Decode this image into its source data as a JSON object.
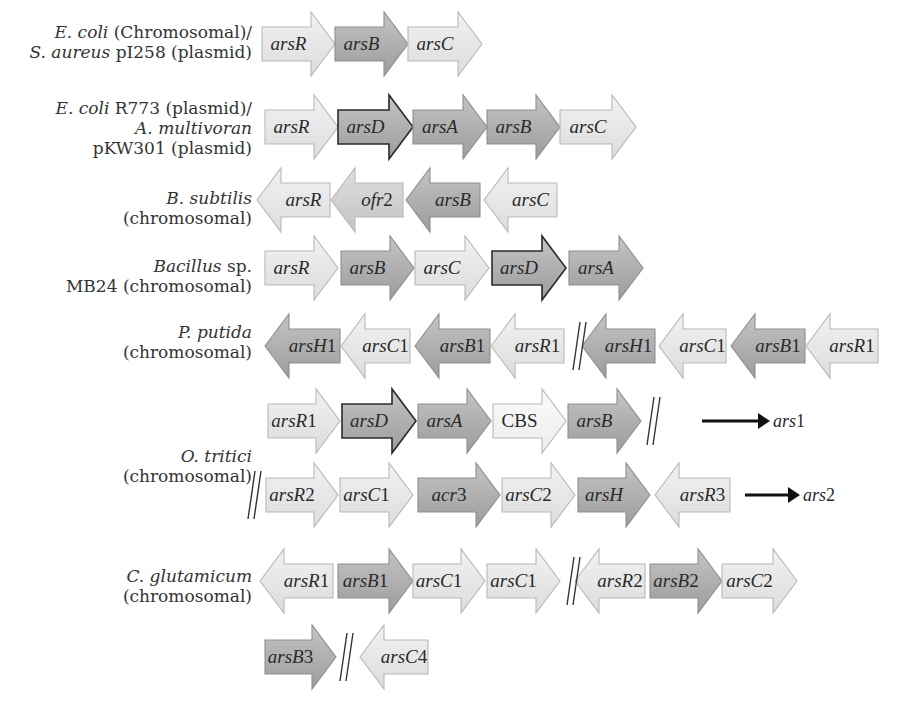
{
  "colors": {
    "light": "#e6e6e6",
    "medium": "#cfcfcf",
    "dark": "#a9a9a9",
    "stroke_light": "#b8b8b8",
    "stroke_dark": "#2b2b2b",
    "text": "#2a2a2a"
  },
  "rows": [
    {
      "id": "ecoli-saureus",
      "label_lines": [
        [
          {
            "t": "E. coli",
            "i": true
          },
          {
            "t": " (Chromosomal)/",
            "i": false
          }
        ],
        [
          {
            "t": "S. aureus",
            "i": true
          },
          {
            "t": " pI258 (plasmid)",
            "i": false
          }
        ]
      ],
      "label_right": 252,
      "label_top": 22,
      "cy": 44,
      "genes": [
        {
          "name": "arsR",
          "italic": "arsR",
          "suffix": "",
          "x1": 262,
          "x2": 335,
          "dir": "right",
          "shade": "light"
        },
        {
          "name": "arsB",
          "italic": "arsB",
          "suffix": "",
          "x1": 335,
          "x2": 408,
          "dir": "right",
          "shade": "dark"
        },
        {
          "name": "arsC",
          "italic": "arsC",
          "suffix": "",
          "x1": 408,
          "x2": 482,
          "dir": "right",
          "shade": "light"
        }
      ]
    },
    {
      "id": "ecoli-r773-amultivoran",
      "label_lines": [
        [
          {
            "t": "E. coli",
            "i": true
          },
          {
            "t": " R773 (plasmid)/",
            "i": false
          }
        ],
        [
          {
            "t": "A. multivoran",
            "i": true
          }
        ],
        [
          {
            "t": "pKW301 (plasmid)",
            "i": false
          }
        ]
      ],
      "label_right": 252,
      "label_top": 98,
      "cy": 127,
      "genes": [
        {
          "name": "arsR",
          "italic": "arsR",
          "suffix": "",
          "x1": 265,
          "x2": 338,
          "dir": "right",
          "shade": "light"
        },
        {
          "name": "arsD",
          "italic": "arsD",
          "suffix": "",
          "x1": 338,
          "x2": 413,
          "dir": "right",
          "shade": "dark",
          "outline": "dark"
        },
        {
          "name": "arsA",
          "italic": "arsA",
          "suffix": "",
          "x1": 413,
          "x2": 487,
          "dir": "right",
          "shade": "dark"
        },
        {
          "name": "arsB",
          "italic": "arsB",
          "suffix": "",
          "x1": 487,
          "x2": 560,
          "dir": "right",
          "shade": "dark"
        },
        {
          "name": "arsC",
          "italic": "arsC",
          "suffix": "",
          "x1": 560,
          "x2": 636,
          "dir": "right",
          "shade": "light"
        }
      ]
    },
    {
      "id": "bsubtilis",
      "label_lines": [
        [
          {
            "t": "B. subtilis",
            "i": true
          }
        ],
        [
          {
            "t": "(chromosomal)",
            "i": false
          }
        ]
      ],
      "label_right": 252,
      "label_top": 188,
      "cy": 200,
      "genes": [
        {
          "name": "arsR",
          "italic": "arsR",
          "suffix": "",
          "x1": 257,
          "x2": 330,
          "dir": "left",
          "shade": "light"
        },
        {
          "name": "ofr2",
          "italic": "ofr",
          "suffix": "2",
          "x1": 331,
          "x2": 403,
          "dir": "left",
          "shade": "medium"
        },
        {
          "name": "arsB",
          "italic": "arsB",
          "suffix": "",
          "x1": 406,
          "x2": 480,
          "dir": "left",
          "shade": "dark"
        },
        {
          "name": "arsC",
          "italic": "arsC",
          "suffix": "",
          "x1": 484,
          "x2": 557,
          "dir": "left",
          "shade": "light"
        }
      ]
    },
    {
      "id": "bacillus-mb24",
      "label_lines": [
        [
          {
            "t": "Bacillus",
            "i": true
          },
          {
            "t": " sp.",
            "i": false
          }
        ],
        [
          {
            "t": "MB24 (chromosomal)",
            "i": false
          }
        ]
      ],
      "label_right": 252,
      "label_top": 256,
      "cy": 268,
      "genes": [
        {
          "name": "arsR",
          "italic": "arsR",
          "suffix": "",
          "x1": 265,
          "x2": 338,
          "dir": "right",
          "shade": "light"
        },
        {
          "name": "arsB",
          "italic": "arsB",
          "suffix": "",
          "x1": 341,
          "x2": 414,
          "dir": "right",
          "shade": "dark"
        },
        {
          "name": "arsC",
          "italic": "arsC",
          "suffix": "",
          "x1": 415,
          "x2": 489,
          "dir": "right",
          "shade": "light"
        },
        {
          "name": "arsD",
          "italic": "arsD",
          "suffix": "",
          "x1": 492,
          "x2": 566,
          "dir": "right",
          "shade": "dark",
          "outline": "dark"
        },
        {
          "name": "arsA",
          "italic": "arsA",
          "suffix": "",
          "x1": 569,
          "x2": 643,
          "dir": "right",
          "shade": "dark"
        }
      ]
    },
    {
      "id": "pputida",
      "label_lines": [
        [
          {
            "t": "P. putida",
            "i": true
          }
        ],
        [
          {
            "t": "(chromosomal)",
            "i": false
          }
        ]
      ],
      "label_right": 252,
      "label_top": 322,
      "cy": 346,
      "breaks": [
        {
          "x": 575
        }
      ],
      "genes": [
        {
          "name": "arsH1",
          "italic": "arsH",
          "suffix": "1",
          "x1": 265,
          "x2": 340,
          "dir": "left",
          "shade": "dark"
        },
        {
          "name": "arsC1",
          "italic": "arsC",
          "suffix": "1",
          "x1": 341,
          "x2": 410,
          "dir": "left",
          "shade": "light"
        },
        {
          "name": "arsB1",
          "italic": "arsB",
          "suffix": "1",
          "x1": 415,
          "x2": 490,
          "dir": "left",
          "shade": "dark"
        },
        {
          "name": "arsR1",
          "italic": "arsR",
          "suffix": "1",
          "x1": 491,
          "x2": 564,
          "dir": "left",
          "shade": "light"
        },
        {
          "name": "arsH1",
          "italic": "arsH",
          "suffix": "1",
          "x1": 582,
          "x2": 655,
          "dir": "left",
          "shade": "dark"
        },
        {
          "name": "arsC1",
          "italic": "arsC",
          "suffix": "1",
          "x1": 659,
          "x2": 726,
          "dir": "left",
          "shade": "light"
        },
        {
          "name": "arsB1",
          "italic": "arsB",
          "suffix": "1",
          "x1": 731,
          "x2": 805,
          "dir": "left",
          "shade": "dark"
        },
        {
          "name": "arsR1",
          "italic": "arsR",
          "suffix": "1",
          "x1": 806,
          "x2": 878,
          "dir": "left",
          "shade": "light"
        }
      ]
    },
    {
      "id": "otritici-ars1",
      "label_lines": [],
      "cy": 421,
      "breaks": [
        {
          "x": 649
        }
      ],
      "operon_arrow": {
        "x1": 702,
        "x2": 770,
        "label_italic": "ars",
        "label_suffix": "1"
      },
      "genes": [
        {
          "name": "arsR1",
          "italic": "arsR",
          "suffix": "1",
          "x1": 268,
          "x2": 340,
          "dir": "right",
          "shade": "light"
        },
        {
          "name": "arsD",
          "italic": "arsD",
          "suffix": "",
          "x1": 342,
          "x2": 416,
          "dir": "right",
          "shade": "dark",
          "outline": "dark"
        },
        {
          "name": "arsA",
          "italic": "arsA",
          "suffix": "",
          "x1": 418,
          "x2": 491,
          "dir": "right",
          "shade": "dark"
        },
        {
          "name": "CBS",
          "italic": "",
          "suffix": "CBS",
          "x1": 493,
          "x2": 566,
          "dir": "right",
          "shade": "white"
        },
        {
          "name": "arsB",
          "italic": "arsB",
          "suffix": "",
          "x1": 568,
          "x2": 641,
          "dir": "right",
          "shade": "dark"
        }
      ]
    },
    {
      "id": "otritici-ars2",
      "label_lines": [],
      "cy": 495,
      "breaks": [
        {
          "x": 250
        }
      ],
      "operon_arrow": {
        "x1": 745,
        "x2": 800,
        "label_italic": "ars",
        "label_suffix": "2"
      },
      "genes": [
        {
          "name": "arsR2",
          "italic": "arsR",
          "suffix": "2",
          "x1": 266,
          "x2": 338,
          "dir": "right",
          "shade": "light"
        },
        {
          "name": "arsC1",
          "italic": "arsC",
          "suffix": "1",
          "x1": 340,
          "x2": 413,
          "dir": "right",
          "shade": "light"
        },
        {
          "name": "acr3",
          "italic": "acr",
          "suffix": "3",
          "x1": 418,
          "x2": 500,
          "dir": "right",
          "shade": "dark"
        },
        {
          "name": "arsC2",
          "italic": "arsC",
          "suffix": "2",
          "x1": 502,
          "x2": 575,
          "dir": "right",
          "shade": "light"
        },
        {
          "name": "arsH",
          "italic": "arsH",
          "suffix": "",
          "x1": 578,
          "x2": 650,
          "dir": "right",
          "shade": "dark"
        },
        {
          "name": "arsR3",
          "italic": "arsR",
          "suffix": "3",
          "x1": 655,
          "x2": 730,
          "dir": "left",
          "shade": "light"
        }
      ]
    },
    {
      "id": "cglutamicum",
      "label_lines": [
        [
          {
            "t": "C. glutamicum",
            "i": true
          }
        ],
        [
          {
            "t": "(chromosomal)",
            "i": false
          }
        ]
      ],
      "label_right": 252,
      "label_top": 566,
      "cy": 581,
      "breaks": [
        {
          "x": 569
        }
      ],
      "genes": [
        {
          "name": "arsR1",
          "italic": "arsR",
          "suffix": "1",
          "x1": 260,
          "x2": 333,
          "dir": "left",
          "shade": "light"
        },
        {
          "name": "arsB1",
          "italic": "arsB",
          "suffix": "1",
          "x1": 338,
          "x2": 413,
          "dir": "right",
          "shade": "dark"
        },
        {
          "name": "arsC1",
          "italic": "arsC",
          "suffix": "1",
          "x1": 413,
          "x2": 485,
          "dir": "right",
          "shade": "light"
        },
        {
          "name": "arsC1",
          "italic": "arsC",
          "suffix": "1",
          "x1": 487,
          "x2": 560,
          "dir": "right",
          "shade": "light"
        },
        {
          "name": "arsR2",
          "italic": "arsR",
          "suffix": "2",
          "x1": 575,
          "x2": 645,
          "dir": "left",
          "shade": "light"
        },
        {
          "name": "arsB2",
          "italic": "arsB",
          "suffix": "2",
          "x1": 650,
          "x2": 722,
          "dir": "right",
          "shade": "dark"
        },
        {
          "name": "arsC2",
          "italic": "arsC",
          "suffix": "2",
          "x1": 722,
          "x2": 797,
          "dir": "right",
          "shade": "light"
        }
      ]
    },
    {
      "id": "cglutamicum-2",
      "label_lines": [],
      "cy": 657,
      "breaks": [
        {
          "x": 342
        }
      ],
      "genes": [
        {
          "name": "arsB3",
          "italic": "arsB",
          "suffix": "3",
          "x1": 265,
          "x2": 336,
          "dir": "right",
          "shade": "dark"
        },
        {
          "name": "arsC4",
          "italic": "arsC",
          "suffix": "4",
          "x1": 360,
          "x2": 428,
          "dir": "left",
          "shade": "light"
        }
      ]
    }
  ],
  "group_labels": [
    {
      "id": "otritici",
      "lines": [
        [
          {
            "t": "O. tritici",
            "i": true
          }
        ],
        [
          {
            "t": "(chromosomal)",
            "i": false
          }
        ]
      ],
      "label_right": 252,
      "label_top": 446
    }
  ]
}
